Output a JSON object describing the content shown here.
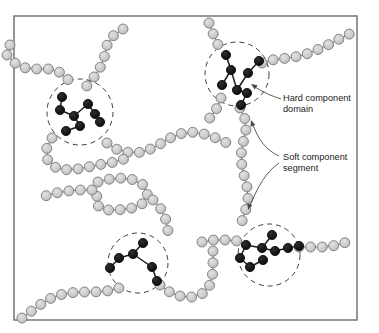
{
  "figure": {
    "background_color": "#ffffff",
    "frame": {
      "name": "diagram-border",
      "x": 14,
      "y": 16,
      "width": 343,
      "height": 304,
      "stroke_color": "#6b6b6b",
      "fill_color": "#ffffff"
    }
  },
  "legend_colors": {
    "soft_bead_fill": "#cccccc",
    "soft_bead_stroke": "#7a7a7a",
    "hard_bead_fill": "#111111",
    "hard_bead_stroke": "#111111",
    "chain_line": "#8a8a8a",
    "domain_circle_stroke": "#3c3c3c",
    "leader_line": "#4a4a4a",
    "text": "#222222"
  },
  "annotations": [
    {
      "name": "hard-component-label",
      "lines": [
        "Hard component",
        "domain"
      ],
      "text_x": 283,
      "text_y": 101,
      "line_height": 11,
      "leader": "M 281 99 C 272 96, 264 93, 252 85",
      "arrow_at": [
        251,
        84
      ],
      "arrow_angle": 213
    },
    {
      "name": "soft-component-label",
      "lines": [
        "Soft component",
        "segment"
      ],
      "text_x": 283,
      "text_y": 160,
      "line_height": 11,
      "leader_upper": "M 279 156 C 266 150, 258 140, 252 122",
      "leader_lower": "M 279 163 C 266 172, 258 186, 249 208",
      "arrow_upper_at": [
        251,
        120
      ],
      "arrow_upper_angle": 252,
      "arrow_lower_at": [
        248,
        210
      ],
      "arrow_lower_angle": 108
    }
  ],
  "domains": [
    {
      "name": "hard-domain-top-left",
      "cx": 80,
      "cy": 112,
      "r": 33,
      "bead_count": 8
    },
    {
      "name": "hard-domain-top-right",
      "cx": 237,
      "cy": 74,
      "r": 32,
      "bead_count": 8
    },
    {
      "name": "hard-domain-bottom-left",
      "cx": 138,
      "cy": 263,
      "r": 30,
      "bead_count": 6
    },
    {
      "name": "hard-domain-bottom-right",
      "cx": 269,
      "cy": 255,
      "r": 31,
      "bead_count": 9
    }
  ],
  "chain_data": {
    "type": "network",
    "soft_bead_radius": 5.0,
    "hard_bead_radius": 4.6,
    "soft_bead_paths": [
      {
        "name": "chain-upper-left-branch",
        "points": [
          [
            7,
            55
          ],
          [
            19,
            67
          ],
          [
            34,
            69
          ],
          [
            49,
            69
          ],
          [
            62,
            73
          ],
          [
            72,
            84
          ]
        ]
      },
      {
        "name": "chain-upper-left-vertical",
        "points": [
          [
            123,
            29
          ],
          [
            113,
            36
          ],
          [
            106,
            47
          ],
          [
            104,
            59
          ],
          [
            99,
            70
          ],
          [
            92,
            80
          ],
          [
            85,
            88
          ]
        ]
      },
      {
        "name": "chain-top-right-long",
        "points": [
          [
            209,
            23
          ],
          [
            214,
            36
          ],
          [
            219,
            47
          ]
        ]
      },
      {
        "name": "chain-right-horizontal",
        "points": [
          [
            262,
            63
          ],
          [
            276,
            59
          ],
          [
            290,
            58
          ],
          [
            304,
            55
          ],
          [
            317,
            50
          ],
          [
            330,
            44
          ],
          [
            343,
            37
          ],
          [
            356,
            31
          ]
        ]
      },
      {
        "name": "chain-upper-right-down",
        "points": [
          [
            221,
            98
          ],
          [
            216,
            110
          ],
          [
            209,
            119
          ]
        ]
      },
      {
        "name": "chain-center-serpentine",
        "points": [
          [
            107,
            143
          ],
          [
            118,
            150
          ],
          [
            131,
            153
          ],
          [
            144,
            152
          ],
          [
            157,
            146
          ],
          [
            168,
            139
          ],
          [
            179,
            134
          ],
          [
            191,
            132
          ],
          [
            204,
            134
          ],
          [
            216,
            138
          ],
          [
            227,
            143
          ]
        ]
      },
      {
        "name": "chain-left-loop",
        "points": [
          [
            52,
            138
          ],
          [
            46,
            150
          ],
          [
            48,
            162
          ],
          [
            58,
            169
          ],
          [
            71,
            170
          ],
          [
            84,
            168
          ],
          [
            97,
            165
          ],
          [
            110,
            163
          ],
          [
            122,
            160
          ],
          [
            133,
            154
          ]
        ]
      },
      {
        "name": "chain-mid-serpentine",
        "points": [
          [
            98,
            182
          ],
          [
            110,
            179
          ],
          [
            123,
            178
          ],
          [
            135,
            180
          ],
          [
            145,
            186
          ],
          [
            148,
            197
          ],
          [
            141,
            205
          ],
          [
            129,
            209
          ],
          [
            116,
            210
          ],
          [
            103,
            210
          ],
          [
            95,
            203
          ],
          [
            98,
            192
          ]
        ]
      },
      {
        "name": "chain-mid-lower",
        "points": [
          [
            92,
            190
          ],
          [
            80,
            190
          ],
          [
            68,
            191
          ],
          [
            56,
            193
          ],
          [
            45,
            196
          ]
        ]
      },
      {
        "name": "chain-descend-to-bottom-left",
        "points": [
          [
            153,
            200
          ],
          [
            161,
            209
          ],
          [
            166,
            220
          ],
          [
            168,
            231
          ],
          [
            166,
            241
          ]
        ]
      },
      {
        "name": "chain-bottom-left-exit",
        "points": [
          [
            22,
            318
          ],
          [
            33,
            310
          ],
          [
            44,
            302
          ],
          [
            55,
            296
          ],
          [
            68,
            293
          ],
          [
            81,
            292
          ],
          [
            94,
            292
          ],
          [
            107,
            291
          ],
          [
            119,
            288
          ]
        ]
      },
      {
        "name": "chain-bottom-valley",
        "points": [
          [
            160,
            285
          ],
          [
            171,
            293
          ],
          [
            183,
            297
          ],
          [
            196,
            297
          ],
          [
            207,
            291
          ],
          [
            212,
            280
          ],
          [
            213,
            268
          ],
          [
            213,
            256
          ],
          [
            213,
            244
          ]
        ]
      },
      {
        "name": "chain-right-vertical-long",
        "points": [
          [
            240,
            108
          ],
          [
            245,
            119
          ],
          [
            246,
            131
          ],
          [
            243,
            143
          ],
          [
            241,
            155
          ],
          [
            242,
            167
          ],
          [
            245,
            179
          ],
          [
            248,
            191
          ],
          [
            248,
            203
          ],
          [
            244,
            215
          ],
          [
            240,
            227
          ]
        ]
      },
      {
        "name": "chain-bottom-right-left-stub",
        "points": [
          [
            202,
            242
          ],
          [
            214,
            240
          ],
          [
            226,
            240
          ],
          [
            238,
            241
          ]
        ]
      },
      {
        "name": "chain-bottom-right-exit",
        "points": [
          [
            299,
            247
          ],
          [
            312,
            247
          ],
          [
            325,
            247
          ],
          [
            338,
            245
          ],
          [
            350,
            241
          ]
        ]
      },
      {
        "name": "chain-left-edge-stub",
        "points": [
          [
            10,
            45
          ]
        ]
      }
    ],
    "hard_bead_paths": [
      {
        "name": "hard-beads-top-left",
        "points": [
          [
            62,
            97
          ],
          [
            60,
            110
          ],
          [
            74,
            116
          ],
          [
            88,
            104
          ],
          [
            95,
            114
          ],
          [
            100,
            122
          ],
          [
            80,
            126
          ],
          [
            66,
            131
          ]
        ],
        "links": [
          [
            0,
            1
          ],
          [
            1,
            2
          ],
          [
            2,
            3
          ],
          [
            3,
            4
          ],
          [
            4,
            5
          ],
          [
            2,
            6
          ],
          [
            6,
            7
          ]
        ]
      },
      {
        "name": "hard-beads-top-right",
        "points": [
          [
            226,
            55
          ],
          [
            231,
            70
          ],
          [
            222,
            85
          ],
          [
            237,
            90
          ],
          [
            248,
            73
          ],
          [
            259,
            61
          ],
          [
            247,
            93
          ],
          [
            241,
            105
          ]
        ],
        "links": [
          [
            0,
            1
          ],
          [
            1,
            2
          ],
          [
            1,
            3
          ],
          [
            3,
            4
          ],
          [
            4,
            5
          ],
          [
            3,
            6
          ],
          [
            6,
            7
          ]
        ]
      },
      {
        "name": "hard-beads-bottom-left",
        "points": [
          [
            143,
            243
          ],
          [
            133,
            254
          ],
          [
            119,
            258
          ],
          [
            110,
            268
          ],
          [
            152,
            267
          ],
          [
            157,
            281
          ]
        ],
        "links": [
          [
            0,
            1
          ],
          [
            1,
            2
          ],
          [
            2,
            3
          ],
          [
            1,
            4
          ],
          [
            4,
            5
          ]
        ]
      },
      {
        "name": "hard-beads-bottom-right",
        "points": [
          [
            272,
            235
          ],
          [
            262,
            248
          ],
          [
            246,
            245
          ],
          [
            240,
            258
          ],
          [
            250,
            267
          ],
          [
            263,
            260
          ],
          [
            275,
            251
          ],
          [
            288,
            248
          ],
          [
            299,
            246
          ]
        ],
        "links": [
          [
            0,
            1
          ],
          [
            1,
            2
          ],
          [
            2,
            3
          ],
          [
            3,
            4
          ],
          [
            4,
            5
          ],
          [
            1,
            6
          ],
          [
            6,
            7
          ],
          [
            7,
            8
          ]
        ]
      }
    ]
  }
}
